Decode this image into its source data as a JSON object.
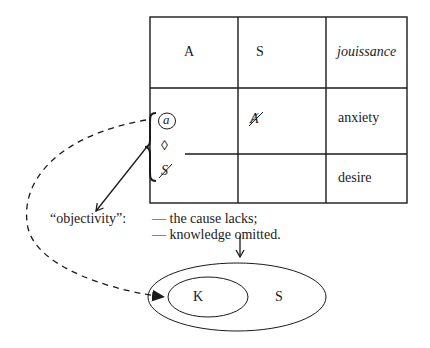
{
  "table": {
    "rows": [
      {
        "cells": [
          "A",
          "S",
          "jouissance"
        ]
      },
      {
        "cells": [
          "a-diamond-barred-S",
          "barred-A",
          "anxiety"
        ]
      },
      {
        "cells": [
          "",
          "",
          "desire"
        ]
      }
    ],
    "row1": {
      "col1": "A",
      "col2": "S",
      "col3": "jouissance"
    },
    "row2": {
      "col2": "Ⱥ",
      "col3": "anxiety"
    },
    "row3": {
      "col3": "desire"
    },
    "brace_group": {
      "top": "a",
      "middle": "◊",
      "bottom": "S"
    }
  },
  "objectivity_label": "“objectivity”:",
  "notes": {
    "line1": "— the cause lacks;",
    "line2": "— knowledge omitted."
  },
  "ellipses": {
    "inner_label": "K",
    "outer_label": "S"
  },
  "colors": {
    "ink": "#1a1a1a",
    "background": "#ffffff"
  }
}
